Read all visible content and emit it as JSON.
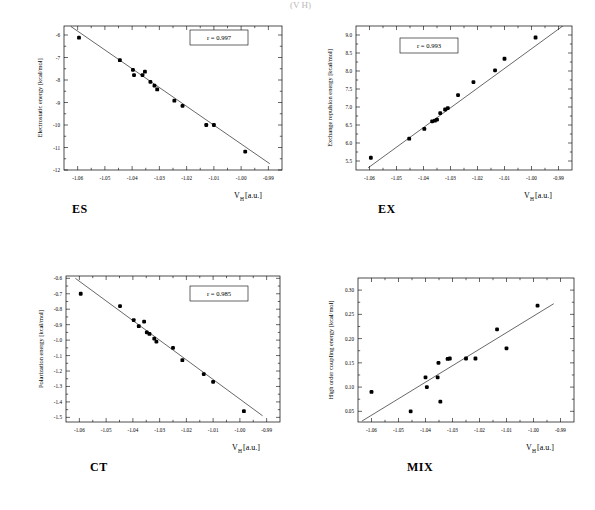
{
  "figure": {
    "top_fragment": "(V H)",
    "panels": [
      {
        "key": "es",
        "caption": "ES",
        "r_label": "r = 0.997",
        "ylabel": "Electrostatic energy [kcal/mol]",
        "xlabel_main": "V",
        "xlabel_sub": "H",
        "xlabel_unit": " [a.u.]"
      },
      {
        "key": "ex",
        "caption": "EX",
        "r_label": "r = 0.993",
        "ylabel": "Exchange repulsion energy [kcal/mol]",
        "xlabel_main": "V",
        "xlabel_sub": "H",
        "xlabel_unit": " [a.u.]"
      },
      {
        "key": "ct",
        "caption": "CT",
        "r_label": "r = 0.985",
        "ylabel": "Polarization energy [kcal/mol]",
        "xlabel_main": "V",
        "xlabel_sub": "H",
        "xlabel_unit": " [a.u.]"
      },
      {
        "key": "mix",
        "caption": "MIX",
        "r_label": "",
        "ylabel": "High order coupling energy [kcal/mol]",
        "xlabel_main": "V",
        "xlabel_sub": "H",
        "xlabel_unit": " [a.u.]"
      }
    ]
  },
  "chart_data": [
    {
      "type": "scatter",
      "id": "es",
      "title": "ES",
      "xlabel": "V_H [a.u.]",
      "ylabel": "Electrostatic energy [kcal/mol]",
      "xlim": [
        -1.065,
        -0.985
      ],
      "ylim": [
        -12,
        -5.6
      ],
      "xticks": [
        -1.06,
        -1.05,
        -1.04,
        -1.03,
        -1.02,
        -1.01,
        -1.0,
        -0.99
      ],
      "xticklabels": [
        "-1.06",
        "-1.05",
        "-1.04",
        "-1.03",
        "-1.02",
        "-1.01",
        "-1.00",
        "-0.99"
      ],
      "yticks": [
        -6,
        -7,
        -8,
        -9,
        -10,
        -11,
        -12
      ],
      "yticklabels": [
        "-6",
        "-7",
        "-8",
        "-9",
        "-10",
        "-11",
        "-12"
      ],
      "grid": false,
      "annotation": "r = 0.997",
      "correlation": 0.997,
      "x": [
        -1.0595,
        -1.0445,
        -1.0397,
        -1.0393,
        -1.0362,
        -1.0353,
        -1.0333,
        -1.0318,
        -1.0308,
        -1.0245,
        -1.0215,
        -1.0128,
        -1.01,
        -0.9985
      ],
      "y": [
        -6.12,
        -7.12,
        -7.55,
        -7.78,
        -7.78,
        -7.63,
        -8.08,
        -8.25,
        -8.42,
        -8.92,
        -9.15,
        -10.0,
        -10.0,
        -11.18
      ],
      "fit_line": {
        "x": [
          -1.0625,
          -0.9895
        ],
        "y": [
          -5.62,
          -11.72
        ]
      }
    },
    {
      "type": "scatter",
      "id": "ex",
      "title": "EX",
      "xlabel": "V_H [a.u.]",
      "ylabel": "Exchange repulsion energy [kcal/mol]",
      "xlim": [
        -1.065,
        -0.985
      ],
      "ylim": [
        5.25,
        9.25
      ],
      "xticks": [
        -1.06,
        -1.05,
        -1.04,
        -1.03,
        -1.02,
        -1.01,
        -1.0,
        -0.99
      ],
      "xticklabels": [
        "-1.06",
        "-1.05",
        "-1.04",
        "-1.03",
        "-1.02",
        "-1.01",
        "-1.00",
        "-0.99"
      ],
      "yticks": [
        5.5,
        6.0,
        6.5,
        7.0,
        7.5,
        8.0,
        8.5,
        9.0
      ],
      "yticklabels": [
        "5.5",
        "6.0",
        "6.5",
        "7.0",
        "7.5",
        "8.0",
        "8.5",
        "9.0"
      ],
      "grid": false,
      "annotation": "r = 0.993",
      "correlation": 0.993,
      "x": [
        -1.0595,
        -1.0453,
        -1.0397,
        -1.0368,
        -1.0358,
        -1.035,
        -1.0338,
        -1.032,
        -1.031,
        -1.0272,
        -1.0215,
        -1.0135,
        -1.01,
        -0.9985
      ],
      "y": [
        5.59,
        6.12,
        6.39,
        6.6,
        6.62,
        6.65,
        6.83,
        6.93,
        6.97,
        7.33,
        7.69,
        8.02,
        8.34,
        8.93
      ],
      "fit_line": {
        "x": [
          -1.0605,
          -0.9875
        ],
        "y": [
          5.31,
          9.3
        ]
      }
    },
    {
      "type": "scatter",
      "id": "ct",
      "title": "CT",
      "xlabel": "V_H [a.u.]",
      "ylabel": "Polarization energy [kcal/mol]",
      "xlim": [
        -1.065,
        -0.985
      ],
      "ylim": [
        -1.53,
        -0.585
      ],
      "xticks": [
        -1.06,
        -1.05,
        -1.04,
        -1.03,
        -1.02,
        -1.01,
        -1.0,
        -0.99
      ],
      "xticklabels": [
        "-1.06",
        "-1.05",
        "-1.04",
        "-1.03",
        "-1.02",
        "-1.01",
        "-1.00",
        "-0.99"
      ],
      "yticks": [
        -0.6,
        -0.7,
        -0.8,
        -0.9,
        -1.0,
        -1.1,
        -1.2,
        -1.3,
        -1.4,
        -1.5
      ],
      "yticklabels": [
        "-0.6",
        "-0.7",
        "-0.8",
        "-0.9",
        "-1.0",
        "-1.1",
        "-1.2",
        "-1.3",
        "-1.4",
        "-1.5"
      ],
      "grid": false,
      "annotation": "r = 0.985",
      "correlation": 0.985,
      "x": [
        -1.0595,
        -1.0448,
        -1.0397,
        -1.0378,
        -1.0358,
        -1.0348,
        -1.0338,
        -1.032,
        -1.0312,
        -1.025,
        -1.0215,
        -1.0135,
        -1.01,
        -0.9985
      ],
      "y": [
        -0.7,
        -0.78,
        -0.87,
        -0.91,
        -0.88,
        -0.95,
        -0.96,
        -0.99,
        -1.01,
        -1.05,
        -1.13,
        -1.22,
        -1.27,
        -1.46
      ],
      "fit_line": {
        "x": [
          -1.0615,
          -0.9915
        ],
        "y": [
          -0.6,
          -1.49
        ]
      }
    },
    {
      "type": "scatter",
      "id": "mix",
      "title": "MIX",
      "xlabel": "V_H [a.u.]",
      "ylabel": "High order coupling energy [kcal/mol]",
      "xlim": [
        -1.065,
        -0.985
      ],
      "ylim": [
        0.028,
        0.325
      ],
      "xticks": [
        -1.06,
        -1.05,
        -1.04,
        -1.03,
        -1.02,
        -1.01,
        -1.0,
        -0.99
      ],
      "xticklabels": [
        "-1.06",
        "-1.05",
        "-1.04",
        "-1.03",
        "-1.02",
        "-1.01",
        "-1.00",
        "-0.99"
      ],
      "yticks": [
        0.05,
        0.1,
        0.15,
        0.2,
        0.25,
        0.3
      ],
      "yticklabels": [
        "0.05",
        "0.10",
        "0.15",
        "0.20",
        "0.25",
        "0.30"
      ],
      "grid": false,
      "annotation": "",
      "x": [
        -1.06,
        -1.0455,
        -1.04,
        -1.0395,
        -1.0355,
        -1.0352,
        -1.0345,
        -1.0318,
        -1.031,
        -1.025,
        -1.0215,
        -1.0135,
        -1.01,
        -0.9985
      ],
      "y": [
        0.09,
        0.05,
        0.12,
        0.1,
        0.12,
        0.15,
        0.07,
        0.158,
        0.159,
        0.159,
        0.159,
        0.219,
        0.18,
        0.268
      ],
      "fit_line": {
        "x": [
          -1.0635,
          -0.9925
        ],
        "y": [
          0.03,
          0.272
        ]
      }
    }
  ]
}
